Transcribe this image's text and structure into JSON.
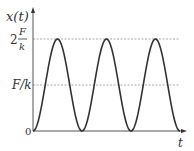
{
  "chart_data": {
    "type": "line",
    "title": "",
    "xlabel": "t",
    "ylabel": "x(t)",
    "function": "x(t) = (F/k)(1 - cos(ωt))",
    "x_range_periods": [
      0,
      3
    ],
    "ylim_in_F_over_k": [
      0,
      2
    ],
    "y_ticks": [
      {
        "value": 0,
        "label": "0"
      },
      {
        "value": 1,
        "label": "F/k"
      },
      {
        "value": 2,
        "label_prefix": "2",
        "label_num": "F",
        "label_den": "k"
      }
    ],
    "reference_lines": [
      {
        "value": 1,
        "style": "dashed"
      },
      {
        "value": 2,
        "style": "dashed"
      }
    ],
    "series": [
      {
        "name": "x(t)",
        "color": "#333333",
        "periods": 3,
        "min": 0,
        "max": 2
      }
    ],
    "grid": false,
    "legend": "none"
  }
}
